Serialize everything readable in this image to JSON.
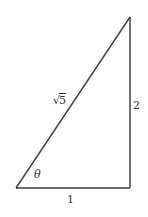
{
  "diagram": {
    "type": "right-triangle",
    "stroke_color": "#3a3a3a",
    "vertices": {
      "bottom_left": [
        16,
        188
      ],
      "bottom_right": [
        130,
        188
      ],
      "top_right": [
        130,
        17
      ]
    },
    "labels": {
      "hypotenuse": {
        "radical": "√",
        "radicand": "5"
      },
      "vertical_side": "2",
      "horizontal_side": "1",
      "angle": "θ"
    }
  }
}
